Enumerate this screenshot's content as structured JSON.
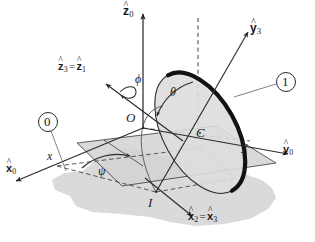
{
  "figure": {
    "type": "kinematics-diagram",
    "colors": {
      "ink": "#1a1a1a",
      "line": "#55565a",
      "ground_fill": "#d9d9d9",
      "plane_fill": "#d2d2d2",
      "disk_fill": "#dcdcdc",
      "rim_dark": "#111111",
      "background": "#ffffff"
    },
    "labels": {
      "z0": {
        "text": "z",
        "sub": "0",
        "hat": true,
        "kind": "vector"
      },
      "z3_z1": {
        "text_a": "z",
        "sub_a": "3",
        "eq": "=",
        "text_b": "z",
        "sub_b": "1",
        "hat": true,
        "kind": "vector"
      },
      "y3": {
        "text": "y",
        "sub": "3",
        "hat": true,
        "kind": "vector"
      },
      "y0": {
        "text": "y",
        "sub": "0",
        "hat": true,
        "kind": "vector"
      },
      "x0": {
        "text": "x",
        "sub": "0",
        "hat": true,
        "kind": "vector"
      },
      "x2_x3": {
        "text_a": "x",
        "sub_a": "2",
        "eq": "=",
        "text_b": "x",
        "sub_b": "3",
        "hat": true,
        "kind": "vector"
      },
      "phi": {
        "text": "ϕ",
        "kind": "angle"
      },
      "theta": {
        "text": "θ",
        "kind": "angle"
      },
      "psi": {
        "text": "ψ",
        "kind": "angle"
      },
      "O": {
        "text": "O",
        "kind": "point"
      },
      "C": {
        "text": "C",
        "kind": "point"
      },
      "I": {
        "text": "I",
        "kind": "point"
      },
      "x_axis": {
        "text": "x",
        "kind": "coordinate"
      },
      "y_axis": {
        "text": "y",
        "kind": "coordinate"
      },
      "body0": {
        "text": "0",
        "kind": "body-number"
      },
      "body1": {
        "text": "1",
        "kind": "body-number"
      }
    }
  }
}
